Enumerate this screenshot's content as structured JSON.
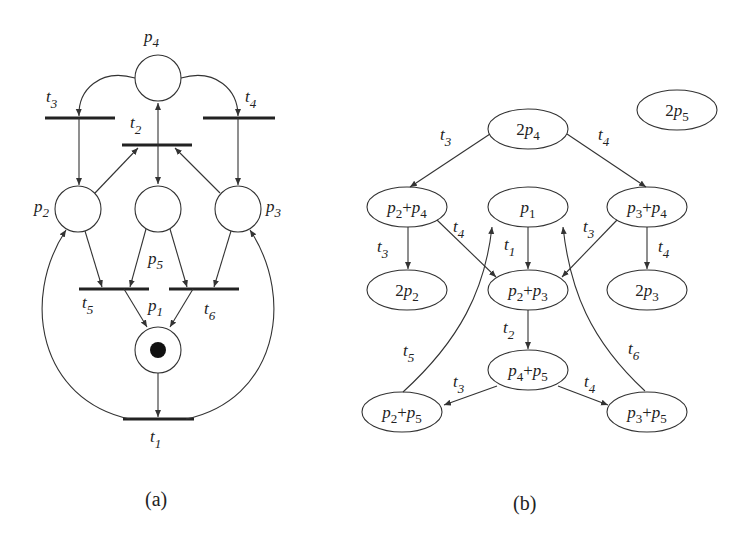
{
  "figure": {
    "panels": [
      {
        "id": "a",
        "caption": "(a)",
        "title": "Petri net",
        "places": [
          {
            "id": "p1",
            "label": "p",
            "sub": "1",
            "tokens": 1
          },
          {
            "id": "p2",
            "label": "p",
            "sub": "2",
            "tokens": 0
          },
          {
            "id": "p3",
            "label": "p",
            "sub": "3",
            "tokens": 0
          },
          {
            "id": "p4",
            "label": "p",
            "sub": "4",
            "tokens": 0
          },
          {
            "id": "p5",
            "label": "p",
            "sub": "5",
            "tokens": 0
          }
        ],
        "transitions": [
          {
            "id": "t1",
            "label": "t",
            "sub": "1"
          },
          {
            "id": "t2",
            "label": "t",
            "sub": "2"
          },
          {
            "id": "t3",
            "label": "t",
            "sub": "3"
          },
          {
            "id": "t4",
            "label": "t",
            "sub": "4"
          },
          {
            "id": "t5",
            "label": "t",
            "sub": "5"
          },
          {
            "id": "t6",
            "label": "t",
            "sub": "6"
          }
        ],
        "arcs": [
          {
            "from": "p4",
            "to": "t3"
          },
          {
            "from": "p4",
            "to": "t4"
          },
          {
            "from": "t3",
            "to": "p2"
          },
          {
            "from": "t4",
            "to": "p3"
          },
          {
            "from": "p2",
            "to": "t2"
          },
          {
            "from": "p3",
            "to": "t2"
          },
          {
            "from": "t2",
            "to": "p4"
          },
          {
            "from": "t2",
            "to": "p5"
          },
          {
            "from": "p2",
            "to": "t5"
          },
          {
            "from": "p5",
            "to": "t5"
          },
          {
            "from": "p5",
            "to": "t6"
          },
          {
            "from": "p3",
            "to": "t6"
          },
          {
            "from": "t5",
            "to": "p1"
          },
          {
            "from": "t6",
            "to": "p1"
          },
          {
            "from": "p1",
            "to": "t1"
          },
          {
            "from": "t1",
            "to": "p2"
          },
          {
            "from": "t1",
            "to": "p3"
          }
        ]
      },
      {
        "id": "b",
        "caption": "(b)",
        "title": "Reachability graph",
        "nodes": [
          {
            "id": "n_2p4",
            "parts": [
              {
                "coef": "2",
                "p": "p",
                "sub": "4"
              }
            ]
          },
          {
            "id": "n_2p5",
            "parts": [
              {
                "coef": "2",
                "p": "p",
                "sub": "5"
              }
            ]
          },
          {
            "id": "n_p2p4",
            "parts": [
              {
                "coef": "",
                "p": "p",
                "sub": "2"
              },
              {
                "coef": "+",
                "p": "p",
                "sub": "4"
              }
            ]
          },
          {
            "id": "n_p1",
            "parts": [
              {
                "coef": "",
                "p": "p",
                "sub": "1"
              }
            ]
          },
          {
            "id": "n_p3p4",
            "parts": [
              {
                "coef": "",
                "p": "p",
                "sub": "3"
              },
              {
                "coef": "+",
                "p": "p",
                "sub": "4"
              }
            ]
          },
          {
            "id": "n_2p2",
            "parts": [
              {
                "coef": "2",
                "p": "p",
                "sub": "2"
              }
            ]
          },
          {
            "id": "n_p2p3",
            "parts": [
              {
                "coef": "",
                "p": "p",
                "sub": "2"
              },
              {
                "coef": "+",
                "p": "p",
                "sub": "3"
              }
            ]
          },
          {
            "id": "n_2p3",
            "parts": [
              {
                "coef": "2",
                "p": "p",
                "sub": "3"
              }
            ]
          },
          {
            "id": "n_p4p5",
            "parts": [
              {
                "coef": "",
                "p": "p",
                "sub": "4"
              },
              {
                "coef": "+",
                "p": "p",
                "sub": "5"
              }
            ]
          },
          {
            "id": "n_p2p5",
            "parts": [
              {
                "coef": "",
                "p": "p",
                "sub": "2"
              },
              {
                "coef": "+",
                "p": "p",
                "sub": "5"
              }
            ]
          },
          {
            "id": "n_p3p5",
            "parts": [
              {
                "coef": "",
                "p": "p",
                "sub": "3"
              },
              {
                "coef": "+",
                "p": "p",
                "sub": "5"
              }
            ]
          }
        ],
        "edges": [
          {
            "from": "2p4",
            "to": "p2+p4",
            "label": "t3"
          },
          {
            "from": "2p4",
            "to": "p3+p4",
            "label": "t4"
          },
          {
            "from": "p2+p4",
            "to": "2p2",
            "label": "t3"
          },
          {
            "from": "p2+p4",
            "to": "p2+p3",
            "label": "t4"
          },
          {
            "from": "p3+p4",
            "to": "p2+p3",
            "label": "t3"
          },
          {
            "from": "p3+p4",
            "to": "2p3",
            "label": "t4"
          },
          {
            "from": "p1",
            "to": "p2+p3",
            "label": "t1"
          },
          {
            "from": "p2+p3",
            "to": "p4+p5",
            "label": "t2"
          },
          {
            "from": "p4+p5",
            "to": "p2+p5",
            "label": "t3"
          },
          {
            "from": "p4+p5",
            "to": "p3+p5",
            "label": "t4"
          },
          {
            "from": "p2+p5",
            "to": "p1",
            "label": "t5"
          },
          {
            "from": "p3+p5",
            "to": "p1",
            "label": "t6"
          }
        ]
      }
    ]
  }
}
